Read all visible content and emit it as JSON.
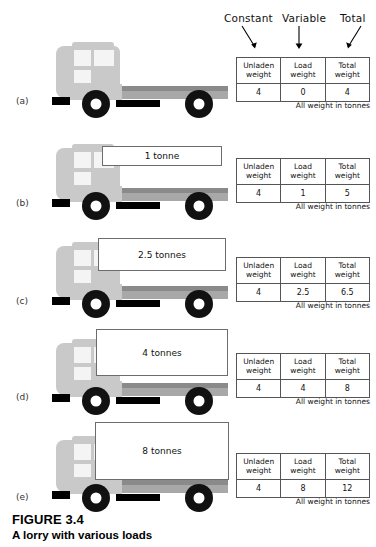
{
  "figure": {
    "title": "FIGURE 3.4",
    "subtitle": "A lorry with various loads"
  },
  "annotations": {
    "constant": "Constant",
    "variable": "Variable",
    "total": "Total"
  },
  "table_headers": {
    "unladen": "Unladen\nweight",
    "unladen_line1": "Unladen",
    "unladen_line2": "weight",
    "load_line1": "Load",
    "load_line2": "weight",
    "total_line1": "Total",
    "total_line2": "weight"
  },
  "table_note": "All weight in tonnes",
  "rows": [
    {
      "label": "(a)",
      "load_label": "",
      "has_load": false,
      "unladen_weight": "4",
      "load_weight": "0",
      "total_weight": "4"
    },
    {
      "label": "(b)",
      "load_label": "1 tonne",
      "has_load": true,
      "unladen_weight": "4",
      "load_weight": "1",
      "total_weight": "5"
    },
    {
      "label": "(c)",
      "load_label": "2.5 tonnes",
      "has_load": true,
      "unladen_weight": "4",
      "load_weight": "2.5",
      "total_weight": "6.5"
    },
    {
      "label": "(d)",
      "load_label": "4 tonnes",
      "has_load": true,
      "unladen_weight": "4",
      "load_weight": "4",
      "total_weight": "8"
    },
    {
      "label": "(e)",
      "load_label": "8 tonnes",
      "has_load": true,
      "unladen_weight": "4",
      "load_weight": "8",
      "total_weight": "12"
    }
  ],
  "colors": {
    "cab": "#c9c9c9",
    "window": "#f4f4f4",
    "bed_top": "#8a8a8a",
    "bed_body": "#a8a8a8",
    "tyre": "#111111",
    "chassis": "#000000",
    "box_border": "#6c6c6c"
  }
}
